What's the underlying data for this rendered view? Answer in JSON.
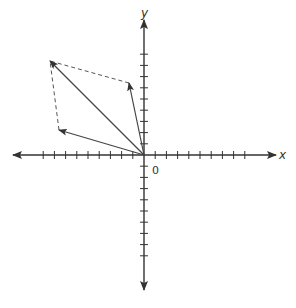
{
  "diagram": {
    "title": "",
    "type": "vector-addition-parallelogram",
    "colors": {
      "axis": "#333333",
      "vector": "#444444",
      "dashed": "#555555",
      "background": "#ffffff"
    },
    "axes": {
      "x_label": "x",
      "y_label": "y",
      "origin_label": "0",
      "origin_px": [
        144,
        155
      ],
      "tick_spacing_px": 11.2,
      "ticks_neg_x": 9,
      "ticks_pos_x": 9,
      "ticks_pos_y": 9,
      "ticks_neg_y": 9
    },
    "vectors": [
      {
        "name": "vector-a",
        "from": [
          0,
          0
        ],
        "to_px": [
          129,
          83
        ],
        "approx_units": [
          -1.3,
          6.4
        ],
        "style": "solid"
      },
      {
        "name": "vector-b",
        "from": [
          0,
          0
        ],
        "to_px": [
          59,
          130
        ],
        "approx_units": [
          -7.5,
          2.2
        ],
        "style": "solid"
      },
      {
        "name": "resultant",
        "from": [
          0,
          0
        ],
        "to_px": [
          50,
          61
        ],
        "approx_units": [
          -8.4,
          8.4
        ],
        "style": "solid"
      }
    ],
    "dashed_lines": [
      {
        "name": "parallelogram-side-from-a",
        "from_px": [
          129,
          83
        ],
        "to_px": [
          50,
          61
        ]
      },
      {
        "name": "parallelogram-side-from-b",
        "from_px": [
          59,
          130
        ],
        "to_px": [
          50,
          61
        ]
      }
    ]
  }
}
